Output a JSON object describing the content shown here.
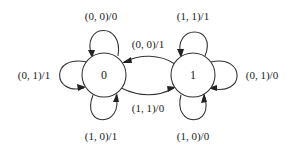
{
  "diagram": {
    "type": "state-machine",
    "states": [
      {
        "id": "0",
        "label": "0"
      },
      {
        "id": "1",
        "label": "1"
      }
    ],
    "transitions": [
      {
        "from": "0",
        "to": "0",
        "label": "(0, 0)/0",
        "position": "top"
      },
      {
        "from": "0",
        "to": "0",
        "label": "(0, 1)/1",
        "position": "left"
      },
      {
        "from": "0",
        "to": "0",
        "label": "(1, 0)/1",
        "position": "bottom"
      },
      {
        "from": "1",
        "to": "0",
        "label": "(0, 0)/1",
        "position": "middle-top"
      },
      {
        "from": "0",
        "to": "1",
        "label": "(1, 1)/0",
        "position": "middle-bottom"
      },
      {
        "from": "1",
        "to": "1",
        "label": "(1, 1)/1",
        "position": "top"
      },
      {
        "from": "1",
        "to": "1",
        "label": "(0, 1)/0",
        "position": "right"
      },
      {
        "from": "1",
        "to": "1",
        "label": "(1, 0)/0",
        "position": "bottom"
      }
    ]
  }
}
